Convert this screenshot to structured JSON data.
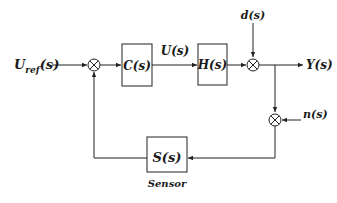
{
  "diagram": {
    "input": {
      "label": "U",
      "subscript": "ref",
      "arg": "(s)"
    },
    "blocks": [
      {
        "id": "controller",
        "label": "C(s)"
      },
      {
        "id": "plant",
        "label": "H(s)"
      },
      {
        "id": "sensor",
        "label": "S(s)",
        "caption": "Sensor"
      }
    ],
    "signals": {
      "control": "U(s)",
      "disturbance": "d(s)",
      "output": "Y(s)",
      "noise": "n(s)"
    },
    "summing_junctions": [
      {
        "id": "error-sum",
        "position": "after-input"
      },
      {
        "id": "disturbance-sum",
        "position": "after-plant"
      },
      {
        "id": "noise-sum",
        "position": "feedback-path"
      }
    ],
    "colors": {
      "stroke": "#222222",
      "background": "#ffffff",
      "text": "#1a1a1a"
    }
  }
}
